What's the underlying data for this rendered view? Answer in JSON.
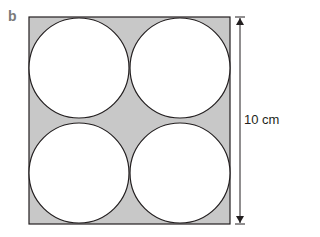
{
  "figure": {
    "part_label": "b",
    "dimension_label": "10 cm",
    "square": {
      "fill": "#c8c8c8",
      "stroke": "#231f20"
    },
    "circles": [
      {
        "position": "top-left",
        "fill": "#ffffff"
      },
      {
        "position": "top-right",
        "fill": "#ffffff"
      },
      {
        "position": "bottom-left",
        "fill": "#ffffff"
      },
      {
        "position": "bottom-right",
        "fill": "#ffffff"
      }
    ],
    "arrow": {
      "type": "double-headed",
      "orientation": "vertical",
      "color": "#231f20"
    }
  }
}
